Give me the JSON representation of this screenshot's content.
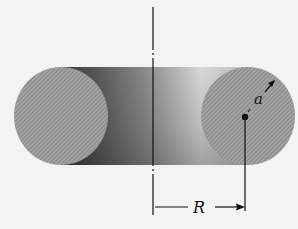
{
  "diagram": {
    "labels": {
      "tube_radius": "a",
      "major_radius": "R"
    },
    "colors": {
      "background": "#f3f3f3",
      "face_fill": "#9a9a9a",
      "hatch": "#6e6e6e",
      "line": "#111111"
    },
    "geometry": {
      "axis_x": 153,
      "left_face": {
        "cx": 61,
        "cy": 116,
        "rx": 47,
        "ry": 49
      },
      "right_face": {
        "cx": 248,
        "cy": 116,
        "rx": 47,
        "ry": 49
      },
      "center_dot": {
        "x": 245,
        "y": 117
      },
      "dimension_line_y": 207
    }
  }
}
